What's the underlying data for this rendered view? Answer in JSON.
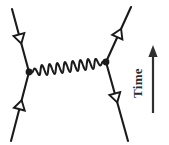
{
  "figure": {
    "kind": "feynman-diagram",
    "title": "",
    "background_color": "#ffffff",
    "ink_color": "#1a1a1a",
    "axis": {
      "label": "Time",
      "direction": "up",
      "label_rotation_deg": -90,
      "arrow": {
        "x": 153,
        "y_tip": 45,
        "y_tail": 113
      }
    },
    "vertices": [
      {
        "name": "left-vertex",
        "x": 29,
        "y": 72,
        "radius": 3.4,
        "style": "filled-dot"
      },
      {
        "name": "right-vertex",
        "x": 106,
        "y": 62,
        "radius": 3.4,
        "style": "filled-dot"
      }
    ],
    "fermion_legs": [
      {
        "name": "incoming-upper-left",
        "from": {
          "x": 12,
          "y": 9
        },
        "to": {
          "x": 29,
          "y": 72
        },
        "arrow_t": 0.47,
        "arrow_direction": "toward-vertex",
        "arrowhead": "hollow-triangle"
      },
      {
        "name": "incoming-lower-left",
        "from": {
          "x": 11,
          "y": 141
        },
        "to": {
          "x": 29,
          "y": 72
        },
        "arrow_t": 0.52,
        "arrow_direction": "toward-vertex",
        "arrowhead": "hollow-triangle"
      },
      {
        "name": "outgoing-upper-right",
        "from": {
          "x": 106,
          "y": 62
        },
        "to": {
          "x": 131,
          "y": 7
        },
        "arrow_t": 0.52,
        "arrow_direction": "away-from-vertex",
        "arrowhead": "hollow-triangle"
      },
      {
        "name": "outgoing-lower-right",
        "from": {
          "x": 106,
          "y": 62
        },
        "to": {
          "x": 128,
          "y": 141
        },
        "arrow_t": 0.45,
        "arrow_direction": "away-from-vertex",
        "arrowhead": "hollow-triangle"
      }
    ],
    "boson_line": {
      "name": "photon-wavy-line",
      "from": {
        "x": 29,
        "y": 72
      },
      "to": {
        "x": 106,
        "y": 62
      },
      "style": "wavy",
      "cycles": 10,
      "amplitude": 5.2
    }
  }
}
